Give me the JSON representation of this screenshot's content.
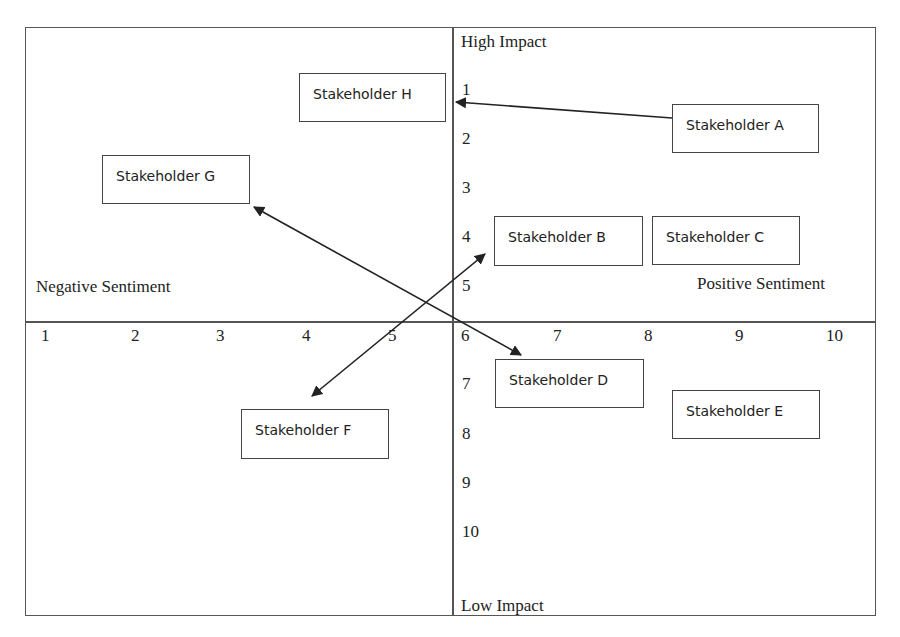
{
  "diagram": {
    "type": "stakeholder_matrix",
    "quadrant_labels": {
      "top": "High Impact",
      "bottom": "Low Impact",
      "left": "Negative Sentiment",
      "right": "Positive Sentiment"
    },
    "x_ticks": [
      "1",
      "2",
      "3",
      "4",
      "5",
      "6",
      "7",
      "8",
      "9",
      "10"
    ],
    "y_ticks": [
      "1",
      "2",
      "3",
      "4",
      "5",
      "6",
      "7",
      "8",
      "9",
      "10"
    ],
    "stakeholders": [
      {
        "id": "A",
        "label": "Stakeholder A"
      },
      {
        "id": "B",
        "label": "Stakeholder B"
      },
      {
        "id": "C",
        "label": "Stakeholder C"
      },
      {
        "id": "D",
        "label": "Stakeholder D"
      },
      {
        "id": "E",
        "label": "Stakeholder E"
      },
      {
        "id": "F",
        "label": "Stakeholder F"
      },
      {
        "id": "G",
        "label": "Stakeholder G"
      },
      {
        "id": "H",
        "label": "Stakeholder H"
      }
    ],
    "arrows": [
      {
        "from": "Stakeholder A",
        "to": "High Impact axis (near 1)",
        "heads": "single"
      },
      {
        "between": [
          "Stakeholder G",
          "Stakeholder D"
        ],
        "heads": "double"
      },
      {
        "between": [
          "Stakeholder F",
          "Stakeholder B"
        ],
        "heads": "double"
      }
    ]
  }
}
